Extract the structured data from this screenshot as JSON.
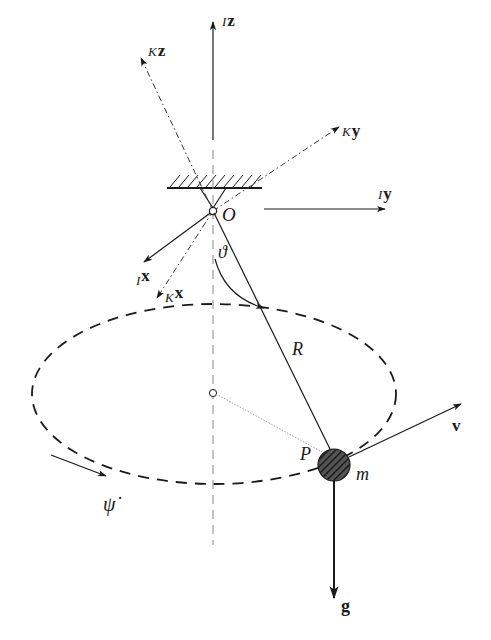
{
  "figure": {
    "colors": {
      "line": "#1a1a1a",
      "light_line": "#777777",
      "background": "#ffffff"
    }
  },
  "labels": {
    "Kz": {
      "sub": "K",
      "vec": "z"
    },
    "Iz": {
      "sub": "I",
      "vec": "z"
    },
    "Ky": {
      "sub": "K",
      "vec": "y"
    },
    "Iy": {
      "sub": "I",
      "vec": "y"
    },
    "Ix": {
      "sub": "I",
      "vec": "x"
    },
    "Kx": {
      "sub": "K",
      "vec": "x"
    },
    "origin": "O",
    "theta": "ϑ",
    "radius": "R",
    "point": "P",
    "mass": "m",
    "velocity": "v",
    "gravity": "g",
    "psi_dot": "ψ̇"
  }
}
